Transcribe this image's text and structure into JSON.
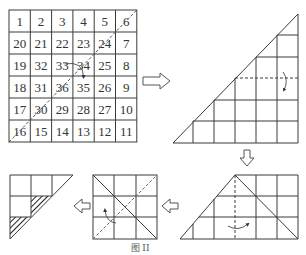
{
  "figure": {
    "caption": "图 II",
    "line_color": "#3a3a3a",
    "dash_color": "#555555"
  },
  "number_grid": {
    "rows": [
      [
        "1",
        "2",
        "3",
        "4",
        "5",
        "6"
      ],
      [
        "20",
        "21",
        "22",
        "23",
        "24",
        "7"
      ],
      [
        "19",
        "32",
        "33",
        "34",
        "25",
        "8"
      ],
      [
        "18",
        "31",
        "36",
        "35",
        "26",
        "9"
      ],
      [
        "17",
        "30",
        "29",
        "28",
        "27",
        "10"
      ],
      [
        "16",
        "15",
        "14",
        "13",
        "12",
        "11"
      ]
    ],
    "fold_line": "dashed diagonal from bottom-left to top-right"
  },
  "steps": [
    {
      "id": "step-1",
      "shape": "right triangle 6x6 (half of grid)",
      "fold": "dashed horizontal line with curved arrow"
    },
    {
      "id": "step-2",
      "shape": "trapezoid 3 rows",
      "fold": "dashed vertical line with curved arrow"
    },
    {
      "id": "step-3",
      "shape": "3x3 square",
      "fold": "dashed diagonal with curved arrow"
    },
    {
      "id": "step-4",
      "shape": "small right triangle with hatched cells"
    }
  ],
  "arrows": [
    {
      "direction": "right"
    },
    {
      "direction": "down"
    },
    {
      "direction": "left"
    },
    {
      "direction": "left"
    }
  ]
}
